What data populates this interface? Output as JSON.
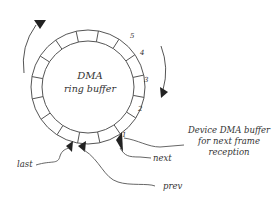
{
  "diagram": {
    "title": "DMA",
    "subtitle": "ring buffer",
    "segment_numbers": [
      "1",
      "2",
      "3",
      "4",
      "5"
    ],
    "labels": {
      "last": "last",
      "prev": "prev",
      "next": "next",
      "device_line1": "Device DMA buffer",
      "device_line2": "for next frame",
      "device_line3": "reception"
    },
    "segment_count": 16,
    "colors": {
      "stroke": "#555555",
      "arrow": "#222222",
      "text": "#333333"
    }
  }
}
